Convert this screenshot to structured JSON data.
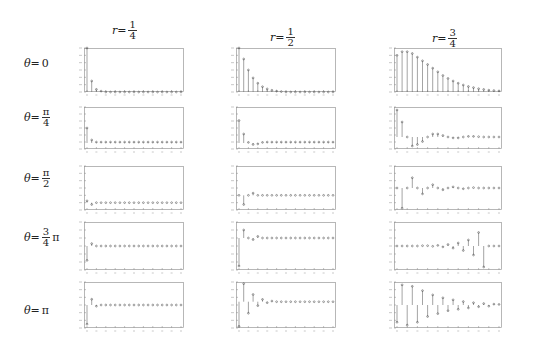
{
  "column_headers": [
    {
      "var": "r=",
      "num": "1",
      "den": "4"
    },
    {
      "var": "r=",
      "num": "1",
      "den": "2"
    },
    {
      "var": "r=",
      "num": "3",
      "den": "4"
    }
  ],
  "row_headers": [
    {
      "var": "θ=",
      "plain": "0"
    },
    {
      "var": "θ=",
      "num": "π",
      "den": "4"
    },
    {
      "var": "θ=",
      "num": "π",
      "den": "2"
    },
    {
      "var": "θ=",
      "num": "3",
      "den": "4",
      "suffix": "π"
    },
    {
      "var": "θ=",
      "plain": "π"
    }
  ],
  "chart_data": {
    "type": "stem",
    "layout": "5 rows (θ) × 3 columns (r) grid",
    "columns": [
      "r=1/4",
      "r=1/2",
      "r=3/4"
    ],
    "rows": [
      "θ=0",
      "θ=π/4",
      "θ=π/2",
      "θ=3π/4",
      "θ=π"
    ],
    "x": [
      0,
      1,
      2,
      3,
      4,
      5,
      6,
      7,
      8,
      9,
      10,
      11,
      12,
      13,
      14,
      15,
      16,
      17,
      18,
      19,
      20
    ],
    "panels": [
      {
        "row": 0,
        "col": 0,
        "ylim": [
          0,
          1
        ],
        "values": [
          1.0,
          0.25,
          0.06,
          0.02,
          0,
          0,
          0,
          0,
          0,
          0,
          0,
          0,
          0,
          0,
          0,
          0,
          0,
          0,
          0,
          0,
          0
        ]
      },
      {
        "row": 0,
        "col": 1,
        "ylim": [
          0,
          1
        ],
        "values": [
          1.0,
          0.75,
          0.5,
          0.32,
          0.2,
          0.12,
          0.07,
          0.04,
          0.02,
          0.01,
          0,
          0,
          0,
          0,
          0,
          0,
          0,
          0,
          0,
          0,
          0
        ]
      },
      {
        "row": 0,
        "col": 2,
        "ylim": [
          0,
          1.2
        ],
        "values": [
          1.0,
          1.1,
          1.1,
          1.05,
          0.95,
          0.85,
          0.75,
          0.65,
          0.55,
          0.45,
          0.37,
          0.3,
          0.24,
          0.19,
          0.15,
          0.12,
          0.09,
          0.07,
          0.05,
          0.04,
          0.03
        ]
      },
      {
        "row": 1,
        "col": 0,
        "ylim": [
          -0.2,
          1.2
        ],
        "values": [
          0.5,
          0.1,
          0.03,
          0.03,
          0.03,
          0.03,
          0.03,
          0.03,
          0.03,
          0.03,
          0.03,
          0.03,
          0.03,
          0.03,
          0.03,
          0.03,
          0.03,
          0.03,
          0.03,
          0.03,
          0.03
        ]
      },
      {
        "row": 1,
        "col": 1,
        "ylim": [
          -0.2,
          1.2
        ],
        "values": [
          0.75,
          0.3,
          0.02,
          -0.05,
          -0.03,
          0.02,
          0.03,
          0.03,
          0.03,
          0.03,
          0.03,
          0.03,
          0.03,
          0.03,
          0.03,
          0.03,
          0.03,
          0.03,
          0.03,
          0.03,
          0.03
        ]
      },
      {
        "row": 1,
        "col": 2,
        "ylim": [
          -0.4,
          1.0
        ],
        "values": [
          0.9,
          0.5,
          0.0,
          -0.3,
          -0.25,
          -0.15,
          0.0,
          0.1,
          0.1,
          0.05,
          0.0,
          -0.03,
          -0.03,
          0.0,
          0.02,
          0.02,
          0.01,
          0.0,
          0.0,
          0.0,
          0.0
        ]
      },
      {
        "row": 2,
        "col": 0,
        "ylim": [
          -0.2,
          1.0
        ],
        "values": [
          0.05,
          -0.05,
          0.0,
          0.0,
          0.0,
          0.0,
          0.0,
          0.0,
          0.0,
          0.0,
          0.0,
          0.0,
          0.0,
          0.0,
          0.0,
          0.0,
          0.0,
          0.0,
          0.0,
          0.0,
          0.0
        ]
      },
      {
        "row": 2,
        "col": 1,
        "ylim": [
          -0.4,
          0.8
        ],
        "values": [
          0.0,
          -0.25,
          0.0,
          0.06,
          0.0,
          0.0,
          0.0,
          0.0,
          0.0,
          0.0,
          0.0,
          0.0,
          0.0,
          0.0,
          0.0,
          0.0,
          0.0,
          0.0,
          0.0,
          0.0,
          0.0
        ]
      },
      {
        "row": 2,
        "col": 2,
        "ylim": [
          -0.6,
          0.6
        ],
        "values": [
          0.0,
          -0.55,
          0.0,
          0.28,
          0.0,
          -0.16,
          0.0,
          0.09,
          0.0,
          -0.05,
          0.0,
          0.03,
          0.0,
          -0.02,
          0.0,
          0.01,
          0.0,
          0.0,
          0.0,
          0.0,
          0.0
        ]
      },
      {
        "row": 3,
        "col": 0,
        "ylim": [
          -0.5,
          0.5
        ],
        "values": [
          -0.3,
          0.05,
          0.0,
          0.0,
          0.0,
          0.0,
          0.0,
          0.0,
          0.0,
          0.0,
          0.0,
          0.0,
          0.0,
          0.0,
          0.0,
          0.0,
          0.0,
          0.0,
          0.0,
          0.0,
          0.0
        ]
      },
      {
        "row": 3,
        "col": 1,
        "ylim": [
          -0.8,
          0.4
        ],
        "values": [
          -0.7,
          0.2,
          0.0,
          -0.04,
          0.04,
          0.0,
          0.0,
          0.0,
          0.0,
          0.0,
          0.0,
          0.0,
          0.0,
          0.0,
          0.0,
          0.0,
          0.0,
          0.0,
          0.0,
          0.0,
          0.0
        ]
      },
      {
        "row": 3,
        "col": 2,
        "ylim": [
          -0.8,
          0.8
        ],
        "values": [
          0.0,
          0.0,
          0.0,
          0.0,
          0.0,
          0.01,
          0.01,
          -0.01,
          0.02,
          -0.03,
          0.05,
          -0.07,
          0.1,
          -0.15,
          0.2,
          -0.3,
          0.45,
          -0.7,
          0.0,
          0.0,
          0.0
        ]
      },
      {
        "row": 4,
        "col": 0,
        "ylim": [
          -0.6,
          0.6
        ],
        "values": [
          -0.5,
          0.15,
          -0.03,
          0.0,
          0.0,
          0.0,
          0.0,
          0.0,
          0.0,
          0.0,
          0.0,
          0.0,
          0.0,
          0.0,
          0.0,
          0.0,
          0.0,
          0.0,
          0.0,
          0.0,
          0.0
        ]
      },
      {
        "row": 4,
        "col": 1,
        "ylim": [
          -0.8,
          0.6
        ],
        "values": [
          -0.75,
          0.55,
          -0.35,
          0.22,
          -0.12,
          0.07,
          -0.03,
          0.02,
          0.0,
          0.0,
          0.0,
          0.0,
          0.0,
          0.0,
          0.0,
          0.0,
          0.0,
          0.0,
          0.0,
          0.0,
          0.0
        ]
      },
      {
        "row": 4,
        "col": 2,
        "ylim": [
          -0.8,
          0.8
        ],
        "values": [
          -0.6,
          0.7,
          -0.7,
          0.65,
          -0.6,
          0.5,
          -0.4,
          0.35,
          -0.3,
          0.25,
          -0.2,
          0.18,
          -0.15,
          0.12,
          -0.1,
          0.08,
          -0.06,
          0.05,
          -0.04,
          0.03,
          0.02
        ]
      }
    ]
  }
}
